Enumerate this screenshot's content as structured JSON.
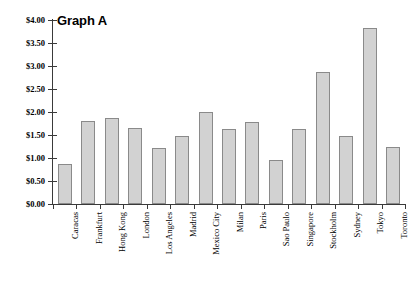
{
  "chart_data": {
    "type": "bar",
    "title": "Graph A",
    "xlabel": "",
    "ylabel": "",
    "ylim": [
      0,
      4
    ],
    "grid": false,
    "legend": null,
    "value_prefix": "$",
    "categories": [
      "Caracas",
      "Frankfurt",
      "Hong Kong",
      "London",
      "Los Angeles",
      "Madrid",
      "Mexico City",
      "Milan",
      "Paris",
      "Sao Paulo",
      "Singapore",
      "Stockholm",
      "Sydney",
      "Tokyo",
      "Toronto"
    ],
    "values": [
      0.88,
      1.8,
      1.87,
      1.66,
      1.22,
      1.48,
      2.01,
      1.63,
      1.78,
      0.96,
      1.63,
      2.86,
      1.48,
      3.82,
      1.24
    ],
    "y_ticks": [
      0,
      0.5,
      1,
      1.5,
      2,
      2.5,
      3,
      3.5,
      4
    ],
    "y_tick_labels": [
      "$0.00",
      "$0.50",
      "$1.00",
      "$1.50",
      "$2.00",
      "$2.50",
      "$3.00",
      "$3.50",
      "$4.00"
    ],
    "colors": {
      "bar_fill": "#d2d2d2",
      "bar_stroke": "#8a8a8a",
      "axis": "#3a3a3a",
      "text": "#000000",
      "background": "#ffffff"
    }
  }
}
